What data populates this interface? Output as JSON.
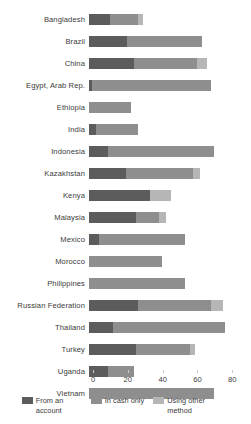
{
  "chart_data": {
    "type": "bar",
    "orientation": "horizontal",
    "stacked": true,
    "title": "",
    "xlabel": "",
    "ylabel": "",
    "xlim": [
      0,
      85
    ],
    "xticks": [
      0,
      20,
      40,
      60,
      80
    ],
    "xtick_labels": [
      "0",
      "20",
      "40",
      "60",
      "80"
    ],
    "grid": false,
    "legend_position": "bottom",
    "categories": [
      "Bangladesh",
      "Brazil",
      "China",
      "Egypt, Arab Rep.",
      "Ethiopia",
      "India",
      "Indonesia",
      "Kazakhstan",
      "Kenya",
      "Malaysia",
      "Mexico",
      "Morocco",
      "Philippines",
      "Russian Federation",
      "Thailand",
      "Turkey",
      "Uganda",
      "Vietnam"
    ],
    "series": [
      {
        "name": "From an account",
        "color": "#5c5c5c",
        "values": [
          12,
          22,
          26,
          2,
          0,
          4,
          11,
          21,
          35,
          27,
          6,
          0,
          0,
          28,
          14,
          27,
          11,
          0
        ]
      },
      {
        "name": "In cash only",
        "color": "#8e8e8e",
        "values": [
          16,
          43,
          36,
          68,
          24,
          24,
          61,
          39,
          0,
          13,
          49,
          42,
          55,
          42,
          64,
          31,
          15,
          72
        ]
      },
      {
        "name": "Using other method",
        "color": "#b6b6b6",
        "values": [
          3,
          0,
          6,
          0,
          0,
          0,
          0,
          4,
          12,
          4,
          0,
          0,
          0,
          7,
          0,
          3,
          0,
          0
        ]
      }
    ],
    "totals": [
      31,
      65,
      68,
      70,
      24,
      28,
      72,
      64,
      47,
      44,
      55,
      42,
      55,
      77,
      78,
      61,
      26,
      72
    ]
  },
  "legend": {
    "items": [
      {
        "label": "From an account",
        "color": "#5c5c5c"
      },
      {
        "label": "In cash only",
        "color": "#8e8e8e"
      },
      {
        "label": "Using other method",
        "color": "#b6b6b6"
      }
    ]
  }
}
